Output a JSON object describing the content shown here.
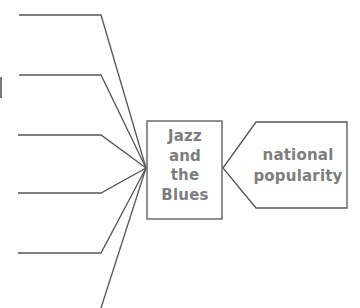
{
  "diagram": {
    "type": "spider-web organizer",
    "center_node": {
      "lines": [
        "Jazz",
        "and",
        "the",
        "Blues"
      ],
      "text": "Jazz and the Blues"
    },
    "side_node": {
      "lines": [
        "national",
        "popularity"
      ],
      "text": "national popularity"
    },
    "branches": [
      {
        "label": ""
      },
      {
        "label": ""
      },
      {
        "label": ""
      },
      {
        "label": ""
      },
      {
        "label": ""
      },
      {
        "label": ""
      }
    ],
    "colors": {
      "line": "#555555",
      "text": "#7d7d7d",
      "background": "#ffffff"
    }
  }
}
